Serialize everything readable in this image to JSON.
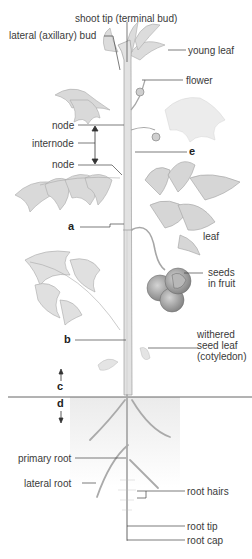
{
  "colors": {
    "plant_fill": "#dcdcdc",
    "plant_stroke": "#a8a8a8",
    "leader_line": "#444444",
    "soil_line": "#555555",
    "soil_shade": "#ececec",
    "fruit_dark": "#8c8c8c",
    "fruit_light": "#c8c8c8"
  },
  "labels": {
    "shoot_tip": "shoot tip (terminal bud)",
    "lateral_bud": "lateral (axillary) bud",
    "young_leaf": "young leaf",
    "flower": "flower",
    "node_upper": "node",
    "internode": "internode",
    "node_lower": "node",
    "e": "e",
    "a": "a",
    "leaf": "leaf",
    "seeds_line1": "seeds",
    "seeds_line2": "in fruit",
    "b": "b",
    "withered_line1": "withered",
    "withered_line2": "seed leaf",
    "withered_line3": "(cotyledon)",
    "c": "c",
    "d": "d",
    "primary_root": "primary root",
    "lateral_root": "lateral root",
    "root_hairs": "root hairs",
    "root_tip": "root tip",
    "root_cap": "root cap"
  }
}
